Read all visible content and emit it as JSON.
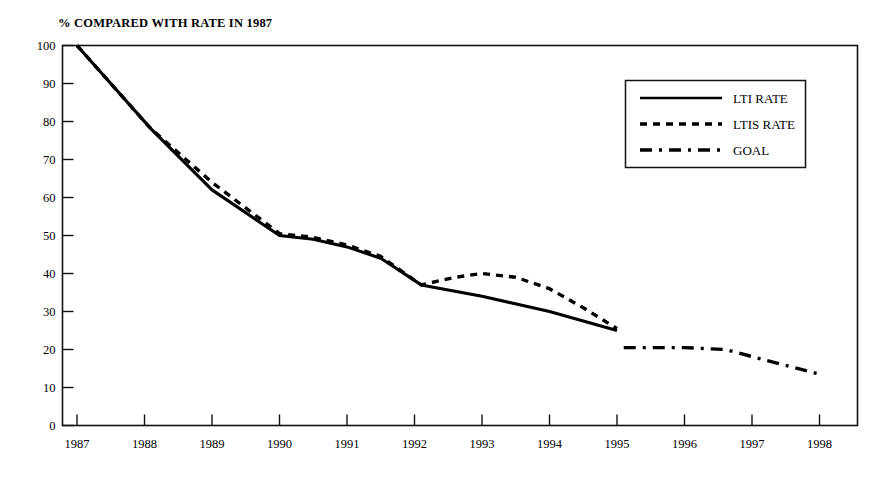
{
  "chart_data": {
    "type": "line",
    "title": "% COMPARED WITH RATE IN 1987",
    "xlabel": "",
    "ylabel": "",
    "grid": false,
    "legend_position": "top-right",
    "xlim": [
      1987,
      1998
    ],
    "ylim": [
      0,
      100
    ],
    "x_ticks": [
      "1987",
      "1988",
      "1989",
      "1990",
      "1991",
      "1992",
      "1993",
      "1994",
      "1995",
      "1996",
      "1997",
      "1998"
    ],
    "y_ticks": [
      "0",
      "10",
      "20",
      "30",
      "40",
      "50",
      "60",
      "70",
      "80",
      "90",
      "100"
    ],
    "series": [
      {
        "name": "LTI RATE",
        "style": "solid",
        "x": [
          1987,
          1988.1,
          1989,
          1990,
          1990.5,
          1991,
          1991.5,
          1992.1,
          1993,
          1994,
          1995
        ],
        "values": [
          100,
          78,
          62,
          50,
          49,
          47,
          44,
          37,
          34,
          30,
          25
        ]
      },
      {
        "name": "LTIS RATE",
        "style": "dashed",
        "x": [
          1987,
          1988.1,
          1989,
          1990,
          1990.5,
          1991,
          1991.5,
          1992.1,
          1992.6,
          1993,
          1993.5,
          1994,
          1994.5,
          1995
        ],
        "values": [
          100,
          78,
          64,
          50.5,
          49.5,
          47.5,
          44.5,
          37,
          39,
          40,
          39,
          36,
          31,
          25.5
        ]
      },
      {
        "name": "GOAL",
        "style": "dash-dot",
        "x": [
          1995.1,
          1996,
          1996.6,
          1998
        ],
        "values": [
          20.5,
          20.5,
          20,
          13.5
        ]
      }
    ]
  },
  "legend": {
    "entries": [
      {
        "label": "LTI RATE",
        "key": "solid-line-key"
      },
      {
        "label": "LTIS RATE",
        "key": "dashed-line-key"
      },
      {
        "label": "GOAL",
        "key": "dash-dot-line-key"
      }
    ]
  }
}
